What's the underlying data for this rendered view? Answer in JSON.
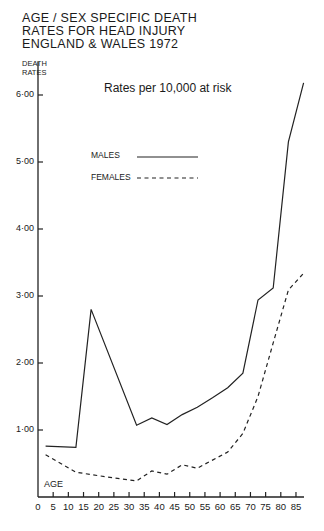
{
  "chart_data": {
    "type": "line",
    "title_lines": [
      "AGE / SEX SPECIFIC DEATH",
      "RATES FOR HEAD INJURY",
      "ENGLAND & WALES 1972"
    ],
    "subtitle": "Rates per 10,000 at risk",
    "xlabel": "AGE",
    "ylabel": "DEATH RATES",
    "ylabel_lines": [
      "DEATH",
      "RATES"
    ],
    "x_ticks": [
      "0",
      "5",
      "10",
      "15",
      "20",
      "25",
      "30",
      "35",
      "40",
      "45",
      "50",
      "55",
      "60",
      "65",
      "70",
      "75",
      "80",
      "85"
    ],
    "y_ticks": [
      "1·00",
      "2·00",
      "3·00",
      "4·00",
      "5·00",
      "6·00"
    ],
    "xlim": [
      0,
      87.5
    ],
    "ylim": [
      0,
      6.2
    ],
    "grid": false,
    "legend_position": "upper-left",
    "series": [
      {
        "name": "MALES",
        "style": "solid",
        "x": [
          2.5,
          12.5,
          17.5,
          32.5,
          37.5,
          42.5,
          47.5,
          52.5,
          57.5,
          62.5,
          67.5,
          72.5,
          77.5,
          82.5,
          87.5
        ],
        "values": [
          0.76,
          0.74,
          2.8,
          1.07,
          1.18,
          1.08,
          1.23,
          1.34,
          1.48,
          1.63,
          1.85,
          2.94,
          3.12,
          5.3,
          6.18
        ]
      },
      {
        "name": "FEMALES",
        "style": "dashed",
        "x": [
          2.5,
          12.5,
          22.5,
          32.5,
          37.5,
          42.5,
          47.5,
          52.5,
          57.5,
          62.5,
          67.5,
          72.5,
          77.5,
          82.5,
          87.5
        ],
        "values": [
          0.63,
          0.37,
          0.3,
          0.24,
          0.39,
          0.34,
          0.48,
          0.43,
          0.55,
          0.67,
          0.95,
          1.5,
          2.3,
          3.09,
          3.34
        ]
      }
    ]
  },
  "legend": {
    "males": "MALES",
    "females": "FEMALES"
  }
}
